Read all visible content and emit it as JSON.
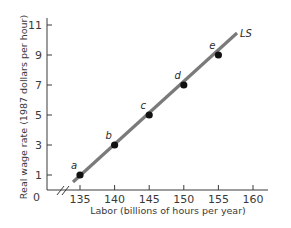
{
  "chart_data": {
    "type": "line",
    "title": "",
    "xlabel": "Labor (billions of hours per year)",
    "ylabel": "Real wage rate (1987 dollars per hour)",
    "x_ticks": [
      "135",
      "140",
      "145",
      "150",
      "155",
      "160"
    ],
    "y_ticks": [
      "1",
      "3",
      "5",
      "7",
      "9",
      "11"
    ],
    "origin_label": "0",
    "xlim": [
      130,
      162
    ],
    "ylim": [
      0,
      11.5
    ],
    "axis_break_x": true,
    "grid": false,
    "series": [
      {
        "name": "LS",
        "color": "#7a7a7a",
        "points": [
          {
            "label": "a",
            "x": 135,
            "y": 1
          },
          {
            "label": "b",
            "x": 140,
            "y": 3
          },
          {
            "label": "c",
            "x": 145,
            "y": 5
          },
          {
            "label": "d",
            "x": 150,
            "y": 7
          },
          {
            "label": "e",
            "x": 155,
            "y": 9
          }
        ]
      }
    ]
  }
}
